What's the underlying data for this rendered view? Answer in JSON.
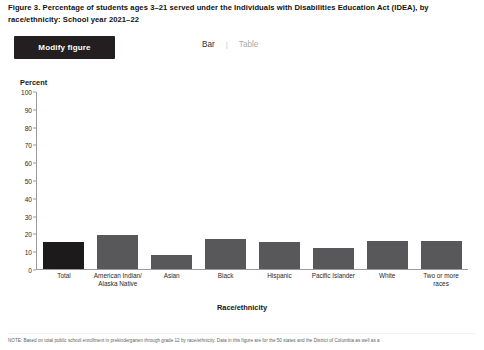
{
  "figure": {
    "title": "Figure 3. Percentage of students ages 3–21 served under the Individuals with Disabilities Education Act (IDEA), by race/ethnicity: School year 2021–22"
  },
  "toolbar": {
    "modify_label": "Modify figure",
    "view_bar": "Bar",
    "view_separator": "|",
    "view_table": "Table",
    "active_view": "Bar"
  },
  "colors": {
    "button_bg": "#231f20",
    "bar_default": "#58585a",
    "bar_total": "#1c1a1b",
    "axis": "#9a9a9a"
  },
  "chart_data": {
    "type": "bar",
    "title": "",
    "xlabel": "Race/ethnicity",
    "ylabel": "Percent",
    "ylim": [
      0,
      100
    ],
    "ytick_labels": [
      "100",
      "90",
      "80",
      "70",
      "60",
      "50",
      "40",
      "30",
      "20",
      "10",
      "0"
    ],
    "ytick_values": [
      100,
      90,
      80,
      70,
      60,
      50,
      40,
      30,
      20,
      10,
      0
    ],
    "grid": false,
    "legend": "none",
    "categories": [
      "Total",
      "American Indian/Alaska Native",
      "Asian",
      "Black",
      "Hispanic",
      "Pacific Islander",
      "White",
      "Two or more races"
    ],
    "values": [
      15,
      19,
      8,
      17,
      15,
      12,
      16,
      16
    ]
  },
  "footnote": {
    "text": "NOTE: Based on total public school enrollment in prekindergarten through grade 12 by race/ethnicity. Data in this figure are for the 50 states and the District of Columbia as well as a"
  }
}
